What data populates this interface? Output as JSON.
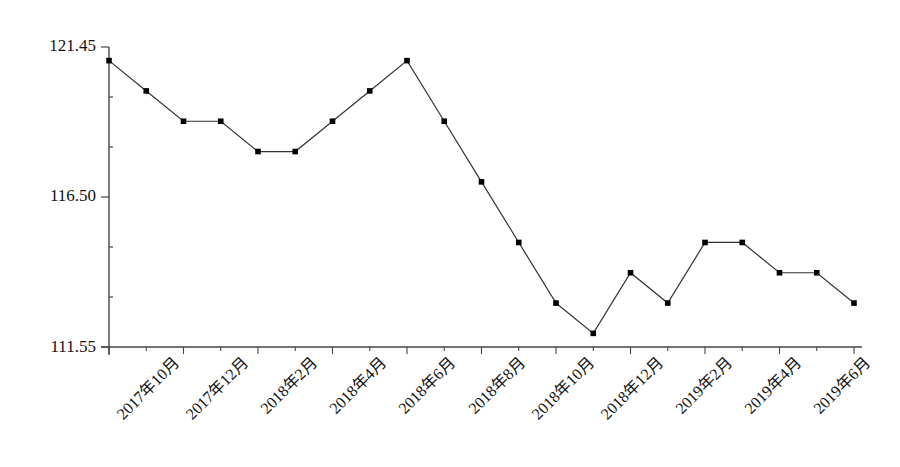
{
  "chart_data": {
    "type": "line",
    "title": "",
    "xlabel": "",
    "ylabel": "",
    "x": [
      "2017年10月",
      "2017年11月",
      "2017年12月",
      "2018年1月",
      "2018年2月",
      "2018年3月",
      "2018年4月",
      "2018年5月",
      "2018年6月",
      "2018年7月",
      "2018年8月",
      "2018年9月",
      "2018年10月",
      "2018年11月",
      "2018年12月",
      "2019年1月",
      "2019年2月",
      "2019年3月",
      "2019年4月",
      "2019年5月",
      "2019年6月"
    ],
    "series": [
      {
        "name": "",
        "values": [
          121,
          120,
          119,
          119,
          118,
          118,
          119,
          120,
          121,
          119,
          117,
          115,
          113,
          112,
          114,
          113,
          115,
          115,
          114,
          114,
          113
        ]
      }
    ],
    "ylim": [
      111.55,
      121.45
    ],
    "y_ticks": [
      "121.45",
      "116.50",
      "111.55"
    ],
    "y_minor_tick_step": 1.65,
    "x_tick_labels": [
      "2017年10月",
      "2017年12月",
      "2018年2月",
      "2018年4月",
      "2018年6月",
      "2018年8月",
      "2018年10月",
      "2018年12月",
      "2019年2月",
      "2019年4月",
      "2019年6月"
    ],
    "grid": false,
    "legend": false,
    "marker": "square",
    "line_color": "#333333",
    "marker_color": "#000000"
  }
}
